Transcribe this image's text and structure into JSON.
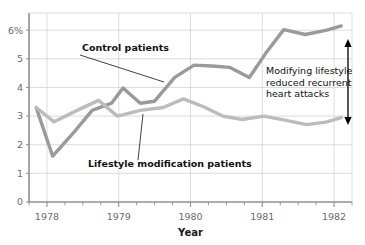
{
  "chart_data": {
    "type": "line",
    "title": "",
    "xlabel": "Year",
    "ylabel": "",
    "xlim": [
      1977.75,
      1982.25
    ],
    "ylim": [
      0,
      6.6
    ],
    "grid": true,
    "legend_position": "inline-annotations",
    "y_ticks": [
      "0",
      "1",
      "2",
      "3",
      "4",
      "5",
      "6%"
    ],
    "y_tick_values": [
      0,
      1,
      2,
      3,
      4,
      5,
      6
    ],
    "x_ticks": [
      "1978",
      "1979",
      "1980",
      "1981",
      "1982"
    ],
    "x_tick_values": [
      1978,
      1979,
      1980,
      1981,
      1982
    ],
    "x_minor_interval": 0.25,
    "series": [
      {
        "name": "Control patients",
        "color": "#9a9a9a",
        "x": [
          1977.85,
          1978.08,
          1978.38,
          1978.63,
          1978.9,
          1979.06,
          1979.3,
          1979.5,
          1979.78,
          1980.05,
          1980.3,
          1980.55,
          1980.82,
          1981.05,
          1981.3,
          1981.6,
          1981.9,
          1982.1
        ],
        "values": [
          3.3,
          1.6,
          2.45,
          3.2,
          3.45,
          3.98,
          3.45,
          3.52,
          4.35,
          4.78,
          4.75,
          4.7,
          4.35,
          5.2,
          6.02,
          5.85,
          6.0,
          6.15
        ]
      },
      {
        "name": "Lifestyle modification patients",
        "color": "#bcbcbc",
        "x": [
          1977.85,
          1978.1,
          1978.42,
          1978.72,
          1978.98,
          1979.3,
          1979.62,
          1979.9,
          1980.16,
          1980.45,
          1980.72,
          1981.02,
          1981.33,
          1981.62,
          1981.9,
          1982.1
        ],
        "values": [
          3.3,
          2.8,
          3.2,
          3.55,
          3.0,
          3.2,
          3.3,
          3.6,
          3.35,
          3.0,
          2.88,
          3.0,
          2.85,
          2.7,
          2.8,
          2.95
        ]
      }
    ],
    "annotations": [
      {
        "name": "control-patients-callout",
        "text": "Control patients",
        "bold": true,
        "text_x": 82,
        "text_y": 51,
        "leader": {
          "x1": 80,
          "y1": 55,
          "x2": 164,
          "y2": 82
        }
      },
      {
        "name": "lifestyle-patients-callout",
        "text": "Lifestyle modification patients",
        "bold": true,
        "text_x": 88,
        "text_y": 167,
        "leader": {
          "x1": 138,
          "y1": 160,
          "x2": 143,
          "y2": 114
        }
      },
      {
        "name": "difference-note",
        "lines": [
          "Modifying lifestyle",
          "reduced recurrent",
          "heart attacks"
        ],
        "bold": false,
        "text_x": 266,
        "text_y": 74
      }
    ],
    "arrow": {
      "name": "difference-arrow",
      "x": 348,
      "y_top": 39,
      "y_bottom": 125,
      "double_headed": true,
      "color": "#000000"
    },
    "colors": {
      "grid": "#d3d3d3",
      "axis": "#8f8f8f",
      "tick_text": "#6b6b6b",
      "plot_background": "#ffffff",
      "page_background": "#ffffff"
    },
    "geometry": {
      "plot_left": 29,
      "plot_right": 352,
      "plot_top": 13,
      "plot_bottom": 202
    }
  }
}
